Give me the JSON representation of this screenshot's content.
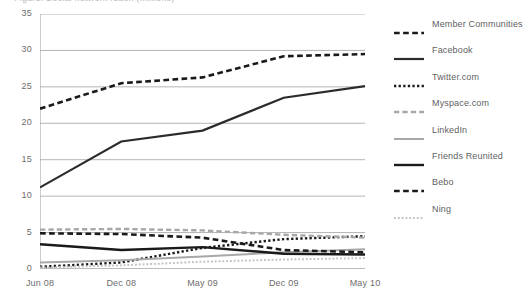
{
  "chart_data": {
    "type": "line",
    "title": "Figure: Social network reach (millions)",
    "xlabel": "",
    "ylabel": "",
    "x": [
      "Jun 08",
      "Dec 08",
      "May 09",
      "Dec 09",
      "May 10"
    ],
    "categories": [
      "Jun 08",
      "Dec 08",
      "May 09",
      "Dec 09",
      "May 10"
    ],
    "xlim": [
      0,
      4
    ],
    "ylim": [
      0,
      35
    ],
    "yticks": [
      0,
      5,
      10,
      15,
      20,
      25,
      30,
      35
    ],
    "grid": true,
    "legend_position": "right",
    "series": [
      {
        "name": "Member Communities",
        "style": "dashed",
        "color": "#1a1a1a",
        "width": 2.6,
        "values": [
          22.0,
          25.5,
          26.3,
          29.2,
          29.5
        ]
      },
      {
        "name": "Facebook",
        "style": "solid",
        "color": "#2b2b2b",
        "width": 2.2,
        "values": [
          11.2,
          17.5,
          19.0,
          23.5,
          25.1
        ]
      },
      {
        "name": "Twitter.com",
        "style": "dotted",
        "color": "#1a1a1a",
        "width": 2.4,
        "values": [
          0.3,
          0.9,
          2.9,
          4.1,
          4.5
        ]
      },
      {
        "name": "Myspace.com",
        "style": "dashed",
        "color": "#a8a8a8",
        "width": 2.4,
        "values": [
          5.4,
          5.5,
          5.3,
          4.7,
          4.3
        ]
      },
      {
        "name": "LinkedIn",
        "style": "solid",
        "color": "#a8a8a8",
        "width": 2.0,
        "values": [
          0.9,
          1.2,
          1.7,
          2.3,
          2.7
        ]
      },
      {
        "name": "Friends Reunited",
        "style": "solid",
        "color": "#1a1a1a",
        "width": 2.4,
        "values": [
          3.4,
          2.6,
          3.0,
          2.1,
          2.0
        ]
      },
      {
        "name": "Bebo",
        "style": "dashed",
        "color": "#1a1a1a",
        "width": 2.6,
        "values": [
          4.9,
          4.8,
          4.3,
          2.6,
          2.3
        ]
      },
      {
        "name": "Ning",
        "style": "dotted",
        "color": "#c2c2c2",
        "width": 2.0,
        "values": [
          0.2,
          0.5,
          1.0,
          1.3,
          1.5
        ]
      }
    ]
  },
  "axis": {
    "y_tick_labels": [
      "35",
      "30",
      "25",
      "20",
      "15",
      "10",
      "5",
      "0"
    ],
    "x_tick_labels": [
      "Jun 08",
      "Dec 08",
      "May 09",
      "Dec 09",
      "May 10"
    ]
  },
  "legend": {
    "items": [
      {
        "label": "Member Communities",
        "swatch": "dashed-black-thick"
      },
      {
        "label": "Facebook",
        "swatch": "solid-black"
      },
      {
        "label": "Twitter.com",
        "swatch": "dotted-black"
      },
      {
        "label": "Myspace.com",
        "swatch": "dashed-gray"
      },
      {
        "label": "LinkedIn",
        "swatch": "solid-gray"
      },
      {
        "label": "Friends Reunited",
        "swatch": "solid-black-thick"
      },
      {
        "label": "Bebo",
        "swatch": "dashed-black"
      },
      {
        "label": "Ning",
        "swatch": "dotted-gray"
      }
    ]
  },
  "colors": {
    "black": "#1a1a1a",
    "gray": "#a8a8a8",
    "light_gray": "#c2c2c2",
    "gridline": "#b4b4b4",
    "axis": "#9a9a9a",
    "text": "#6d6d6d",
    "background": "#ffffff"
  }
}
